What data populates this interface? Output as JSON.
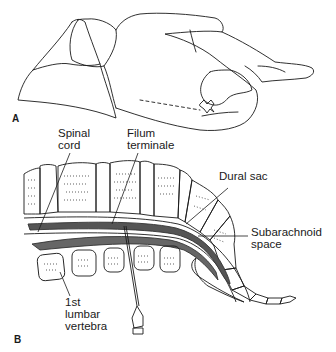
{
  "figure": {
    "panel_a": {
      "letter": "A",
      "description": "patient lying in lateral decubitus position, knees drawn up, head on pillow"
    },
    "panel_b": {
      "letter": "B",
      "labels": {
        "spinal_cord_1": "Spinal",
        "spinal_cord_2": "cord",
        "filum_1": "Filum",
        "filum_2": "terminale",
        "dural_sac": "Dural sac",
        "subarachnoid_1": "Subarachnoid",
        "subarachnoid_2": "space",
        "lumbar_1": "1st",
        "lumbar_2": "lumbar",
        "lumbar_3": "vertebra"
      }
    }
  },
  "colors": {
    "line": "#1a1a1a",
    "cord": "#555555",
    "background": "#ffffff"
  }
}
